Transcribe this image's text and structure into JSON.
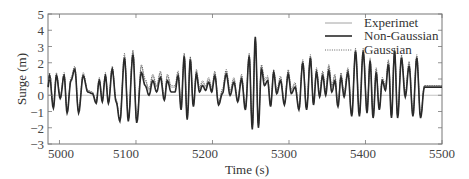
{
  "chart_data": {
    "type": "line",
    "title": "",
    "xlabel": "Time (s)",
    "ylabel": "Surge (m)",
    "xlim": [
      4985,
      5500
    ],
    "ylim": [
      -3,
      5
    ],
    "xticks": [
      5000,
      5100,
      5200,
      5300,
      5400,
      5500
    ],
    "yticks": [
      -3,
      -2,
      -1,
      0,
      1,
      2,
      3,
      4,
      5
    ],
    "grid": false,
    "zero_line": true,
    "legend_position": "upper right",
    "legend": [
      "Experimet",
      "Non-Gaussian",
      "Gaussian"
    ],
    "series": [
      {
        "name": "Experimet",
        "style": "solid-thin",
        "color": "#888888",
        "x": [
          4985,
          4987,
          4992,
          4996,
          5001,
          5006,
          5010,
          5015,
          5020,
          5025,
          5031,
          5037,
          5043,
          5048,
          5052,
          5056,
          5060,
          5064,
          5069,
          5074,
          5079,
          5085,
          5090,
          5096,
          5101,
          5107,
          5112,
          5117,
          5122,
          5127,
          5132,
          5137,
          5141,
          5146,
          5151,
          5155,
          5159,
          5163,
          5167,
          5171,
          5175,
          5179,
          5183,
          5187,
          5191,
          5195,
          5199,
          5203,
          5208,
          5213,
          5218,
          5223,
          5228,
          5233,
          5238,
          5243,
          5248,
          5252,
          5256,
          5260,
          5264,
          5268,
          5272,
          5276,
          5280,
          5284,
          5289,
          5294,
          5299,
          5303,
          5308,
          5313,
          5318,
          5323,
          5328,
          5332,
          5336,
          5340,
          5344,
          5348,
          5352,
          5356,
          5360,
          5364,
          5368,
          5372,
          5377,
          5382,
          5387,
          5392,
          5397,
          5402,
          5406,
          5410,
          5414,
          5418,
          5422,
          5426,
          5430,
          5434,
          5438,
          5442,
          5447,
          5452,
          5457,
          5462,
          5467,
          5472,
          5477,
          5482,
          5487,
          5492,
          5497,
          5500
        ],
        "y": [
          0.6,
          1.3,
          -0.7,
          1.3,
          -0.1,
          1.3,
          -1.0,
          1.0,
          1.7,
          -1.0,
          1.3,
          0.3,
          0.2,
          -0.4,
          1.0,
          -0.3,
          1.3,
          -0.4,
          1.7,
          -0.3,
          -1.5,
          2.4,
          -1.5,
          2.7,
          -1.6,
          1.8,
          0.9,
          0.3,
          1.2,
          0.5,
          1.4,
          -0.2,
          1.2,
          0.5,
          0.5,
          1.4,
          -0.8,
          2.5,
          -1.4,
          2.3,
          -0.6,
          1.5,
          0.4,
          0.8,
          0.5,
          1.0,
          0.4,
          1.4,
          -0.5,
          0.3,
          1.5,
          0.2,
          1.0,
          -0.3,
          1.2,
          -0.8,
          2.5,
          -2.0,
          3.4,
          -1.8,
          1.8,
          0.9,
          1.1,
          -0.6,
          1.5,
          0.2,
          1.1,
          -0.5,
          1.5,
          0.3,
          0.7,
          -0.8,
          2.1,
          -0.8,
          2.4,
          -0.5,
          1.6,
          0.0,
          1.4,
          0.2,
          1.8,
          0.5,
          1.2,
          -0.6,
          1.3,
          0.0,
          1.6,
          -1.2,
          2.8,
          -1.2,
          2.8,
          -1.0,
          2.2,
          -1.3,
          1.6,
          -0.8,
          1.0,
          0.5,
          2.1,
          -1.3,
          2.8,
          -1.3,
          2.4,
          0.1,
          2.0,
          -1.2,
          2.4,
          -1.3,
          0.6,
          0.6,
          0.6,
          0.6,
          0.6,
          0.6
        ],
        "note": "Approximate peak/trough trace digitized from image"
      },
      {
        "name": "Non-Gaussian",
        "style": "solid-thick",
        "color": "#2a2a2a",
        "x": [
          4985,
          4987,
          4992,
          4996,
          5001,
          5006,
          5010,
          5015,
          5020,
          5025,
          5031,
          5037,
          5043,
          5048,
          5052,
          5056,
          5060,
          5064,
          5069,
          5074,
          5079,
          5085,
          5090,
          5096,
          5101,
          5107,
          5112,
          5117,
          5122,
          5127,
          5132,
          5137,
          5141,
          5146,
          5151,
          5155,
          5159,
          5163,
          5167,
          5171,
          5175,
          5179,
          5183,
          5187,
          5191,
          5195,
          5199,
          5203,
          5208,
          5213,
          5218,
          5223,
          5228,
          5233,
          5238,
          5243,
          5248,
          5252,
          5256,
          5260,
          5264,
          5268,
          5272,
          5276,
          5280,
          5284,
          5289,
          5294,
          5299,
          5303,
          5308,
          5313,
          5318,
          5323,
          5328,
          5332,
          5336,
          5340,
          5344,
          5348,
          5352,
          5356,
          5360,
          5364,
          5368,
          5372,
          5377,
          5382,
          5387,
          5392,
          5397,
          5402,
          5406,
          5410,
          5414,
          5418,
          5422,
          5426,
          5430,
          5434,
          5438,
          5442,
          5447,
          5452,
          5457,
          5462,
          5467,
          5472,
          5477,
          5482,
          5487,
          5492,
          5497,
          5500
        ],
        "y": [
          0.5,
          1.2,
          -0.8,
          1.2,
          -0.2,
          1.2,
          -1.1,
          0.9,
          1.6,
          -1.1,
          1.2,
          0.2,
          0.1,
          -0.5,
          0.9,
          -0.4,
          1.2,
          -0.5,
          1.6,
          -0.4,
          -1.6,
          2.3,
          -1.6,
          2.5,
          -1.7,
          1.4,
          0.6,
          0.0,
          0.9,
          0.2,
          1.1,
          -0.3,
          0.9,
          0.2,
          0.2,
          1.2,
          -0.9,
          2.4,
          -1.5,
          2.2,
          -0.7,
          1.3,
          0.2,
          0.6,
          0.3,
          0.8,
          0.2,
          1.2,
          -0.6,
          0.1,
          1.3,
          0.0,
          0.8,
          -0.4,
          1.0,
          -0.9,
          2.4,
          -2.1,
          3.6,
          -2.0,
          1.6,
          0.6,
          0.9,
          -0.7,
          1.4,
          0.1,
          0.9,
          -0.6,
          1.3,
          0.1,
          0.5,
          -0.9,
          2.0,
          -0.9,
          2.3,
          -0.6,
          1.4,
          -0.1,
          1.2,
          0.0,
          1.5,
          0.2,
          0.9,
          -0.7,
          1.1,
          -0.1,
          1.4,
          -1.3,
          2.7,
          -1.3,
          2.7,
          -1.1,
          2.1,
          -1.4,
          1.4,
          -0.9,
          0.9,
          0.3,
          1.9,
          -1.4,
          2.7,
          -1.4,
          2.3,
          -0.1,
          1.8,
          -1.3,
          2.3,
          -1.4,
          0.5,
          0.5,
          0.5,
          0.5,
          0.5,
          0.5
        ]
      },
      {
        "name": "Gaussian",
        "style": "dotted",
        "color": "#555555",
        "x": [
          4985,
          4987,
          4992,
          4996,
          5001,
          5006,
          5010,
          5015,
          5020,
          5025,
          5031,
          5037,
          5043,
          5048,
          5052,
          5056,
          5060,
          5064,
          5069,
          5074,
          5079,
          5085,
          5090,
          5096,
          5101,
          5107,
          5112,
          5117,
          5122,
          5127,
          5132,
          5137,
          5141,
          5146,
          5151,
          5155,
          5159,
          5163,
          5167,
          5171,
          5175,
          5179,
          5183,
          5187,
          5191,
          5195,
          5199,
          5203,
          5208,
          5213,
          5218,
          5223,
          5228,
          5233,
          5238,
          5243,
          5248,
          5252,
          5256,
          5260,
          5264,
          5268,
          5272,
          5276,
          5280,
          5284,
          5289,
          5294,
          5299,
          5303,
          5308,
          5313,
          5318,
          5323,
          5328,
          5332,
          5336,
          5340,
          5344,
          5348,
          5352,
          5356,
          5360,
          5364,
          5368,
          5372,
          5377,
          5382,
          5387,
          5392,
          5397,
          5402,
          5406,
          5410,
          5414,
          5418,
          5422,
          5426,
          5430,
          5434,
          5438,
          5442,
          5447,
          5452,
          5457,
          5462,
          5467,
          5472,
          5477,
          5482,
          5487,
          5492,
          5497,
          5500
        ],
        "y": [
          0.6,
          1.4,
          -0.7,
          1.4,
          -0.1,
          1.4,
          -1.0,
          1.1,
          1.8,
          -1.0,
          1.4,
          0.3,
          0.2,
          -0.4,
          1.1,
          -0.3,
          1.4,
          -0.4,
          1.8,
          -0.3,
          -1.5,
          2.6,
          -1.5,
          2.8,
          -1.6,
          1.9,
          1.0,
          0.4,
          1.3,
          0.6,
          1.5,
          -0.2,
          1.3,
          0.6,
          0.6,
          1.5,
          -0.8,
          2.6,
          -1.4,
          2.4,
          -0.6,
          1.6,
          0.5,
          0.9,
          0.6,
          1.1,
          0.5,
          1.5,
          -0.5,
          0.4,
          1.6,
          0.3,
          1.1,
          -0.3,
          1.3,
          -0.8,
          2.6,
          -2.0,
          3.5,
          -1.9,
          1.9,
          1.0,
          1.2,
          -0.6,
          1.6,
          0.3,
          1.2,
          -0.5,
          1.6,
          0.4,
          0.8,
          -0.8,
          2.2,
          -0.8,
          2.5,
          -0.5,
          1.7,
          0.1,
          1.5,
          0.3,
          1.9,
          0.6,
          1.3,
          -0.6,
          1.4,
          0.1,
          1.7,
          -1.2,
          2.9,
          -1.2,
          2.9,
          -1.0,
          2.3,
          -1.3,
          1.7,
          -0.8,
          1.1,
          0.6,
          2.2,
          -1.3,
          2.9,
          -1.3,
          2.5,
          0.2,
          2.1,
          -1.2,
          2.5,
          -1.3,
          0.6,
          0.6,
          0.6,
          0.6,
          0.6,
          0.6
        ]
      }
    ]
  },
  "axes": {
    "xlabel": "Time (s)",
    "ylabel": "Surge (m)",
    "xtick_labels": [
      "5000",
      "5100",
      "5200",
      "5300",
      "5400",
      "5500"
    ],
    "ytick_labels": [
      "5",
      "4",
      "3",
      "2",
      "1",
      "0",
      "-1",
      "-2",
      "-3"
    ]
  },
  "legend": {
    "items": [
      {
        "label": "Experimet",
        "style": "solid-thin"
      },
      {
        "label": "Non-Gaussian",
        "style": "solid-thick"
      },
      {
        "label": "Gaussian",
        "style": "dotted"
      }
    ]
  }
}
